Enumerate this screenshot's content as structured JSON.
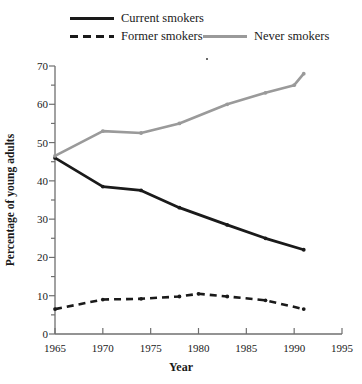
{
  "chart_data": {
    "type": "line",
    "title": "",
    "xlabel": "Year",
    "ylabel": "Percentage of young adults",
    "xlim": [
      1965,
      1995
    ],
    "ylim": [
      0,
      70
    ],
    "xticks": [
      1965,
      1970,
      1975,
      1980,
      1985,
      1990,
      1995
    ],
    "yticks": [
      0,
      10,
      20,
      30,
      40,
      50,
      60,
      70
    ],
    "y_minor_tick_step": 5,
    "grid": false,
    "legend_position": "above-plot",
    "series": [
      {
        "name": "Current smokers",
        "color": "#1a1a1a",
        "style": "solid",
        "x": [
          1965,
          1970,
          1974,
          1978,
          1983,
          1987,
          1991
        ],
        "values": [
          46,
          38.5,
          37.5,
          33,
          28.5,
          25,
          22
        ]
      },
      {
        "name": "Former smokers",
        "color": "#1a1a1a",
        "style": "dashed",
        "x": [
          1965,
          1970,
          1974,
          1978,
          1980,
          1983,
          1987,
          1991
        ],
        "values": [
          6.5,
          9,
          9.2,
          9.8,
          10.5,
          9.8,
          8.8,
          6.5
        ]
      },
      {
        "name": "Never smokers",
        "color": "#9a9a9a",
        "style": "solid",
        "x": [
          1965,
          1970,
          1974,
          1978,
          1983,
          1987,
          1990,
          1991
        ],
        "values": [
          46.5,
          53,
          52.5,
          55,
          60,
          63,
          65,
          68
        ]
      }
    ]
  },
  "legend": {
    "entries": [
      {
        "label": "Current smokers"
      },
      {
        "label": "Former smokers"
      },
      {
        "label": "Never smokers"
      }
    ]
  },
  "axes": {
    "x": {
      "title": "Year",
      "tick_labels": [
        "1965",
        "1970",
        "1975",
        "1980",
        "1985",
        "1990",
        "1995"
      ]
    },
    "y": {
      "title": "Percentage of young adults",
      "tick_labels": [
        "0",
        "10",
        "20",
        "30",
        "40",
        "50",
        "60",
        "70"
      ]
    }
  }
}
